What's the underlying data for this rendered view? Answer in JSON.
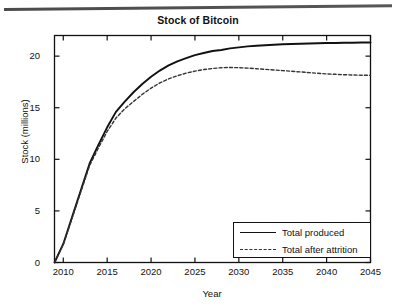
{
  "chart_data": {
    "type": "line",
    "title": "Stock of Bitcoin",
    "xlabel": "Year",
    "ylabel": "Stock (millions)",
    "xlim": [
      2009,
      2045
    ],
    "ylim": [
      0,
      22
    ],
    "grid": false,
    "legend_position": "bottom-right",
    "xticks": [
      2010,
      2015,
      2020,
      2025,
      2030,
      2035,
      2040,
      2045
    ],
    "yticks": [
      0,
      5,
      10,
      15,
      20
    ],
    "x": [
      2009,
      2010,
      2011,
      2012,
      2013,
      2014,
      2015,
      2016,
      2017,
      2018,
      2019,
      2020,
      2021,
      2022,
      2023,
      2024,
      2025,
      2026,
      2027,
      2028,
      2029,
      2030,
      2031,
      2032,
      2033,
      2034,
      2035,
      2036,
      2037,
      2038,
      2039,
      2040,
      2041,
      2042,
      2043,
      2044,
      2045
    ],
    "series": [
      {
        "name": "Total produced",
        "style": "solid",
        "color": "#111111",
        "values": [
          0.0,
          1.8,
          4.4,
          7.0,
          9.6,
          11.4,
          13.1,
          14.6,
          15.6,
          16.5,
          17.3,
          18.0,
          18.6,
          19.1,
          19.5,
          19.8,
          20.1,
          20.3,
          20.5,
          20.6,
          20.75,
          20.85,
          20.95,
          21.0,
          21.05,
          21.1,
          21.15,
          21.18,
          21.2,
          21.22,
          21.25,
          21.27,
          21.28,
          21.3,
          21.3,
          21.32,
          21.32
        ]
      },
      {
        "name": "Total after attrition",
        "style": "dashed",
        "color": "#333333",
        "values": [
          0.0,
          1.75,
          4.3,
          6.85,
          9.4,
          11.1,
          12.7,
          14.0,
          14.9,
          15.6,
          16.3,
          16.9,
          17.4,
          17.8,
          18.1,
          18.35,
          18.55,
          18.7,
          18.8,
          18.88,
          18.9,
          18.88,
          18.84,
          18.78,
          18.72,
          18.66,
          18.6,
          18.53,
          18.47,
          18.4,
          18.34,
          18.28,
          18.24,
          18.2,
          18.17,
          18.15,
          18.15
        ]
      }
    ]
  },
  "legend": {
    "entries": [
      {
        "label": "Total produced"
      },
      {
        "label": "Total after attrition"
      }
    ]
  }
}
